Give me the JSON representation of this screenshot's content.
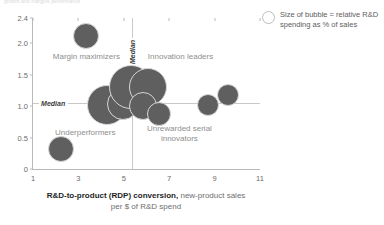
{
  "top_cut_text": "growth and margins performance",
  "legend": {
    "icon": "bubble-outline-icon",
    "line1": "Size of bubble = relative R&D",
    "line2": "spending as % of sales"
  },
  "axis": {
    "x_title_bold": "R&D-to-product (RDP) conversion,",
    "x_title_rest": " new-product sales",
    "x_title_line2": "per $ of R&D spend"
  },
  "chart_data": {
    "type": "scatter",
    "title": "",
    "subtitle": "",
    "xlabel": "R&D-to-product (RDP) conversion, new-product sales per $ of R&D spend",
    "ylabel": "",
    "xlim": [
      1,
      11
    ],
    "ylim": [
      0,
      2.4
    ],
    "xticks": [
      "1",
      "3",
      "5",
      "7",
      "9",
      "11"
    ],
    "xtick_values": [
      1,
      3,
      5,
      7,
      9,
      11
    ],
    "yticks": [
      "0",
      "0.5",
      "1.0",
      "1.5",
      "2.0",
      "2.4"
    ],
    "ytick_values": [
      0,
      0.5,
      1.0,
      1.5,
      2.0,
      2.4
    ],
    "grid": false,
    "legend_position": "top-right",
    "size_encoding": "Size of bubble = relative R&D spending as % of sales",
    "reference_lines": [
      {
        "orientation": "vertical",
        "value": 5.35,
        "label": "Median"
      },
      {
        "orientation": "horizontal",
        "value": 1.05,
        "label": "Median"
      }
    ],
    "quadrant_labels": [
      {
        "label": "Margin maximizers",
        "x": 3.35,
        "y": 1.78
      },
      {
        "label": "Innovation leaders",
        "x": 7.5,
        "y": 1.78
      },
      {
        "label": "Underperformers",
        "x": 3.3,
        "y": 0.58
      },
      {
        "label": "Unrewarded serial innovators",
        "x": 7.45,
        "y": 0.56
      }
    ],
    "points": [
      {
        "x": 3.35,
        "y": 2.11,
        "size": 13
      },
      {
        "x": 2.25,
        "y": 0.32,
        "size": 13
      },
      {
        "x": 4.25,
        "y": 1.02,
        "size": 20
      },
      {
        "x": 4.95,
        "y": 1.04,
        "size": 16
      },
      {
        "x": 5.3,
        "y": 1.3,
        "size": 22
      },
      {
        "x": 5.85,
        "y": 1.18,
        "size": 10
      },
      {
        "x": 6.05,
        "y": 1.3,
        "size": 19
      },
      {
        "x": 5.85,
        "y": 1.0,
        "size": 14
      },
      {
        "x": 6.55,
        "y": 0.88,
        "size": 12
      },
      {
        "x": 8.7,
        "y": 1.02,
        "size": 11
      },
      {
        "x": 9.6,
        "y": 1.18,
        "size": 11
      }
    ]
  }
}
